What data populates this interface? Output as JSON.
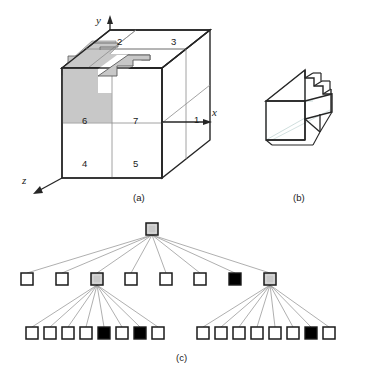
{
  "figure": {
    "captions": [
      {
        "id": "a",
        "label": "(a)"
      },
      {
        "id": "b",
        "label": "(b)"
      },
      {
        "id": "c",
        "label": "(c)"
      }
    ],
    "colors": {
      "line": "#262626",
      "thin_line": "#8c8c8c",
      "partial_fill": "#c8c8c8",
      "full_fill": "#000000",
      "empty_fill": "#ffffff",
      "text": "#1a1a1a",
      "background": "#ffffff"
    }
  },
  "panel_a": {
    "caption": "(a)",
    "axes": [
      {
        "name": "y-axis",
        "label": "y",
        "direction": "up"
      },
      {
        "name": "x-axis",
        "label": "x",
        "direction": "right"
      },
      {
        "name": "z-axis",
        "label": "z",
        "direction": "down-left"
      }
    ],
    "octant_labels": [
      {
        "id": 1,
        "label": "1"
      },
      {
        "id": 2,
        "label": "2"
      },
      {
        "id": 3,
        "label": "3"
      },
      {
        "id": 4,
        "label": "4"
      },
      {
        "id": 5,
        "label": "5"
      },
      {
        "id": 6,
        "label": "6"
      },
      {
        "id": 7,
        "label": "7"
      }
    ],
    "shaded_octants": [
      "2",
      "6"
    ]
  },
  "panel_b": {
    "caption": "(b)",
    "description": "staircase solid"
  },
  "panel_c": {
    "caption": "(c)",
    "legend_states": [
      "empty",
      "partial",
      "full"
    ],
    "levels": [
      {
        "name": "root-level",
        "nodes": [
          {
            "index": 0,
            "state": "partial"
          }
        ]
      },
      {
        "name": "level-1",
        "nodes": [
          {
            "index": 0,
            "state": "empty"
          },
          {
            "index": 1,
            "state": "empty"
          },
          {
            "index": 2,
            "state": "partial"
          },
          {
            "index": 3,
            "state": "empty"
          },
          {
            "index": 4,
            "state": "empty"
          },
          {
            "index": 5,
            "state": "empty"
          },
          {
            "index": 6,
            "state": "full"
          },
          {
            "index": 7,
            "state": "partial"
          }
        ]
      },
      {
        "name": "level-2-group-left",
        "parent_index": 2,
        "nodes": [
          {
            "index": 0,
            "state": "empty"
          },
          {
            "index": 1,
            "state": "empty"
          },
          {
            "index": 2,
            "state": "empty"
          },
          {
            "index": 3,
            "state": "empty"
          },
          {
            "index": 4,
            "state": "full"
          },
          {
            "index": 5,
            "state": "empty"
          },
          {
            "index": 6,
            "state": "full"
          },
          {
            "index": 7,
            "state": "empty"
          }
        ]
      },
      {
        "name": "level-2-group-right",
        "parent_index": 7,
        "nodes": [
          {
            "index": 0,
            "state": "empty"
          },
          {
            "index": 1,
            "state": "empty"
          },
          {
            "index": 2,
            "state": "empty"
          },
          {
            "index": 3,
            "state": "empty"
          },
          {
            "index": 4,
            "state": "empty"
          },
          {
            "index": 5,
            "state": "empty"
          },
          {
            "index": 6,
            "state": "full"
          },
          {
            "index": 7,
            "state": "empty"
          }
        ]
      }
    ]
  }
}
